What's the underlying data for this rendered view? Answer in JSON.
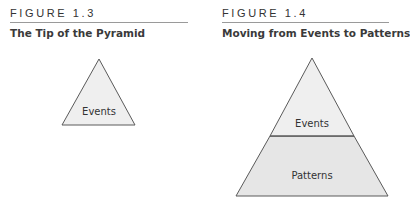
{
  "figures": [
    {
      "number": "FIGURE 1.3",
      "title": "The Tip of the Pyramid",
      "levels": [
        "Events"
      ]
    },
    {
      "number": "FIGURE 1.4",
      "title": "Moving from Events to Patterns",
      "levels": [
        "Events",
        "Patterns"
      ]
    }
  ],
  "colors": {
    "stroke": "#5a5a5a",
    "fill": "#efefef",
    "rule": "#9a9a9a"
  }
}
